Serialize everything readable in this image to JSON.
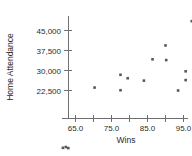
{
  "chart_data": {
    "type": "scatter",
    "title": "",
    "xlabel": "Wins",
    "ylabel": "Home Attendance",
    "xlim": [
      60.0,
      99.0
    ],
    "ylim": [
      0,
      51000
    ],
    "grid": false,
    "legend": "none",
    "xticks": [
      65.0,
      70.0,
      75.0,
      80.0,
      85.0,
      90.0,
      95.0
    ],
    "xtick_labels": [
      "65.0",
      "",
      "75.0",
      "",
      "85.0",
      "",
      "95.0"
    ],
    "yticks": [
      22500,
      30000,
      37500,
      45000
    ],
    "ytick_labels": [
      "22,500",
      "30,000",
      "37,500",
      "45,000"
    ],
    "marker_color": "#585858",
    "axis_color": "#6f6f6f",
    "points": [
      {
        "x": 61.5,
        "y": 1000
      },
      {
        "x": 62.3,
        "y": 1300
      },
      {
        "x": 63.0,
        "y": 900
      },
      {
        "x": 70.3,
        "y": 23600
      },
      {
        "x": 77.5,
        "y": 28400
      },
      {
        "x": 77.5,
        "y": 22600
      },
      {
        "x": 79.5,
        "y": 27100
      },
      {
        "x": 84.0,
        "y": 26200
      },
      {
        "x": 86.4,
        "y": 34200
      },
      {
        "x": 90.0,
        "y": 39400
      },
      {
        "x": 90.2,
        "y": 33900
      },
      {
        "x": 93.5,
        "y": 22500
      },
      {
        "x": 95.6,
        "y": 29700
      },
      {
        "x": 95.6,
        "y": 26400
      },
      {
        "x": 97.3,
        "y": 48500
      }
    ]
  },
  "axis": {
    "xlabel": "Wins",
    "ylabel": "Home Attendance"
  }
}
